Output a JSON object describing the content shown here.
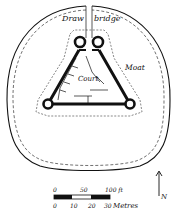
{
  "diagram": {
    "type": "castle-plan",
    "labels": {
      "drawbridge_left": "Draw",
      "drawbridge_right": "bridge",
      "court": "Court",
      "moat": "Moat"
    },
    "scale": {
      "feet_ticks": [
        "0",
        "50",
        "100 ft"
      ],
      "metre_ticks": [
        "0",
        "10",
        "20",
        "30"
      ],
      "metres_label": "Metres"
    },
    "north": {
      "label": "N"
    },
    "colors": {
      "ink": "#111111",
      "background": "#ffffff"
    }
  }
}
